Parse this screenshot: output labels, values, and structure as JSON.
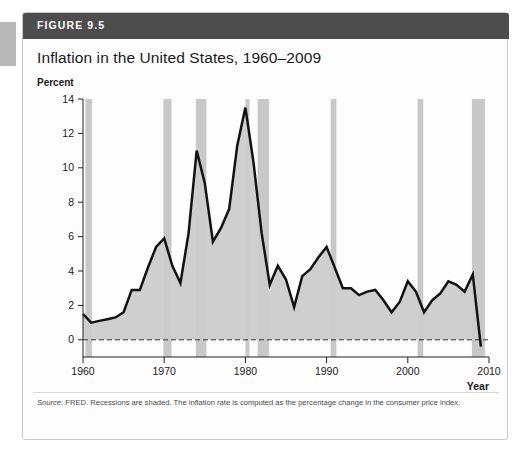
{
  "figure": {
    "label": "FIGURE 9.5",
    "title": "Inflation in the United States, 1960–2009",
    "y_unit_label": "Percent",
    "source_prefix": "Source:",
    "source_text": " FRED. Recessions are shaded. The inflation rate is computed as the percentage change in the consumer price index."
  },
  "colors": {
    "header_bar": "#4d4d4d",
    "line": "#121212",
    "area_fill": "#cccccc",
    "recession_band": "#c8c8c8",
    "zero_line": "#333333",
    "card_border": "#c9c9c9",
    "page_edge": "#b9b9b9"
  },
  "chart_data": {
    "type": "line",
    "title": "Inflation in the United States, 1960–2009",
    "xlabel": "Year",
    "ylabel": "Percent",
    "xlim": [
      1960,
      2010
    ],
    "ylim": [
      -1,
      14
    ],
    "xticks": [
      1960,
      1970,
      1980,
      1990,
      2000,
      2010
    ],
    "yticks": [
      0,
      2,
      4,
      6,
      8,
      10,
      12,
      14
    ],
    "grid": false,
    "legend": "none",
    "zero_reference_line": 0,
    "x": [
      1960,
      1961,
      1962,
      1963,
      1964,
      1965,
      1966,
      1967,
      1968,
      1969,
      1970,
      1971,
      1972,
      1973,
      1974,
      1975,
      1976,
      1977,
      1978,
      1979,
      1980,
      1981,
      1982,
      1983,
      1984,
      1985,
      1986,
      1987,
      1988,
      1989,
      1990,
      1991,
      1992,
      1993,
      1994,
      1995,
      1996,
      1997,
      1998,
      1999,
      2000,
      2001,
      2002,
      2003,
      2004,
      2005,
      2006,
      2007,
      2008,
      2009
    ],
    "values": [
      1.5,
      1.0,
      1.1,
      1.2,
      1.3,
      1.6,
      2.9,
      2.9,
      4.2,
      5.4,
      5.9,
      4.3,
      3.3,
      6.2,
      11.0,
      9.1,
      5.7,
      6.5,
      7.6,
      11.3,
      13.5,
      10.3,
      6.2,
      3.2,
      4.3,
      3.5,
      1.9,
      3.7,
      4.1,
      4.8,
      5.4,
      4.2,
      3.0,
      3.0,
      2.6,
      2.8,
      2.9,
      2.3,
      1.6,
      2.2,
      3.4,
      2.8,
      1.6,
      2.3,
      2.7,
      3.4,
      3.2,
      2.8,
      3.8,
      -0.4
    ],
    "series_name": "Inflation rate",
    "recessions": [
      {
        "start": 1960.3,
        "end": 1961.1
      },
      {
        "start": 1969.9,
        "end": 1970.9
      },
      {
        "start": 1973.9,
        "end": 1975.2
      },
      {
        "start": 1980.0,
        "end": 1980.5
      },
      {
        "start": 1981.5,
        "end": 1982.9
      },
      {
        "start": 1990.5,
        "end": 1991.2
      },
      {
        "start": 2001.2,
        "end": 2001.9
      },
      {
        "start": 2007.9,
        "end": 2009.5
      }
    ],
    "annotations": [
      {
        "label": "Year",
        "role": "x-axis-title"
      },
      {
        "label": "Percent",
        "role": "y-axis-title"
      }
    ]
  }
}
